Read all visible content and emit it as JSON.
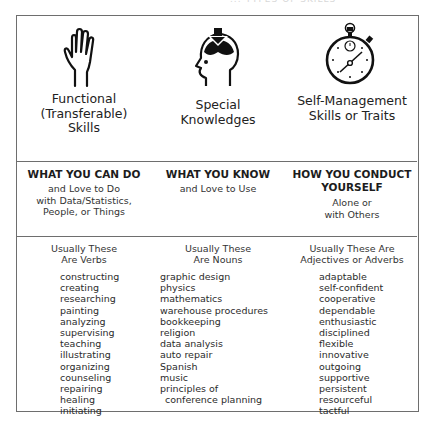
{
  "page": {
    "top_title_fragment": "... TYPES OF SKILLS"
  },
  "columns": [
    {
      "icon": "raised-hand-icon",
      "title_lines": [
        "Functional",
        "(Transferable)",
        "Skills"
      ],
      "heading": "WHAT YOU CAN DO",
      "sub_lines": [
        "and Love to Do",
        "with Data/Statistics,",
        "People, or Things"
      ],
      "kind_lines": [
        "Usually These",
        "Are Verbs"
      ],
      "items": [
        "constructing",
        "creating",
        "researching",
        "painting",
        "analyzing",
        "supervising",
        "teaching",
        "illustrating",
        "organizing",
        "counseling",
        "repairing",
        "healing",
        "initiating"
      ]
    },
    {
      "icon": "head-knowledge-download-icon",
      "title_lines": [
        "Special",
        "Knowledges"
      ],
      "heading": "WHAT YOU KNOW",
      "sub_lines": [
        "and Love to Use"
      ],
      "kind_lines": [
        "Usually These",
        "Are Nouns"
      ],
      "items": [
        "graphic design",
        "physics",
        "mathematics",
        "warehouse procedures",
        "bookkeeping",
        "religion",
        "data analysis",
        "auto repair",
        "Spanish",
        "music",
        "principles of",
        "conference planning"
      ]
    },
    {
      "icon": "stopwatch-icon",
      "title_lines": [
        "Self-Management",
        "Skills or Traits"
      ],
      "heading_lines": [
        "HOW YOU CONDUCT",
        "YOURSELF"
      ],
      "sub_lines": [
        "Alone or",
        "with Others"
      ],
      "kind_lines": [
        "Usually These Are",
        "Adjectives or Adverbs"
      ],
      "items": [
        "adaptable",
        "self-confident",
        "cooperative",
        "dependable",
        "enthusiastic",
        "disciplined",
        "flexible",
        "innovative",
        "outgoing",
        "supportive",
        "persistent",
        "resourceful",
        "tactful"
      ]
    }
  ],
  "colors": {
    "border": "#6e6e6e",
    "text": "#2a2a2a",
    "icon": "#111111"
  }
}
